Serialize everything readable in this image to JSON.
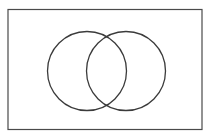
{
  "figure": {
    "kind": "venn-diagram",
    "title": "",
    "canvas": {
      "width": 211,
      "height": 139,
      "background_color": "#ffffff"
    },
    "frame": {
      "name": "outer-rectangle",
      "x": 8,
      "y": 9.5,
      "width": 194,
      "height": 120,
      "stroke_color": "#4a4a4a",
      "stroke_width": 1.2,
      "fill_color": "#ffffff"
    },
    "sets": [
      {
        "name": "left-set",
        "label": "",
        "cx": 87,
        "cy": 71,
        "r": 39.5,
        "stroke_color": "#3b3b3b",
        "stroke_width": 1.3,
        "fill_color": "none"
      },
      {
        "name": "right-set",
        "label": "",
        "cx": 126,
        "cy": 71,
        "r": 39.5,
        "stroke_color": "#3b3b3b",
        "stroke_width": 1.3,
        "fill_color": "none"
      }
    ],
    "intersection": {
      "name": "overlap-lens",
      "label": "",
      "top_point": {
        "x": 106.5,
        "y": 37
      },
      "bottom_point": {
        "x": 106.5,
        "y": 105
      },
      "center_x": 106.5,
      "fill_color": "none"
    },
    "region_labels": []
  }
}
